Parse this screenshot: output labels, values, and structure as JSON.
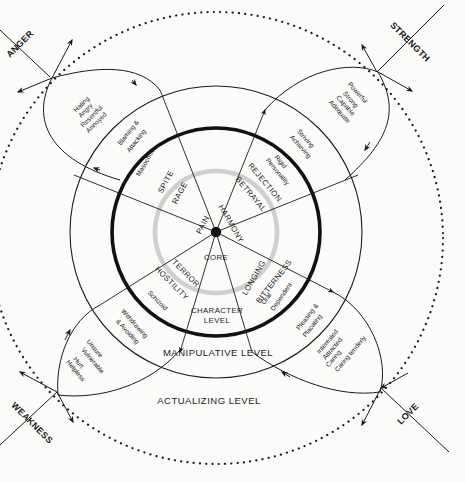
{
  "diagram": {
    "center": {
      "label": "CORE"
    },
    "levels": {
      "character": [
        "CHARACTER",
        "LEVEL"
      ],
      "manipulative": "MANIPULATIVE LEVEL",
      "actualizing": "ACTUALIZING LEVEL"
    },
    "corners": {
      "anger": "ANGER",
      "strength": "STRENGTH",
      "weakness": "WEAKNESS",
      "love": "LOVE"
    },
    "core_words": {
      "pain": "PAIN",
      "harmony": "HARMONY"
    },
    "quadrants": {
      "upper_left": {
        "inner": [
          "SPITE",
          "RAGE"
        ],
        "character": "Masochist",
        "manipulative": [
          "Blaming &",
          "Attacking"
        ],
        "actualizing": [
          "Hating",
          "Angry",
          "Resentful",
          "Annoyed"
        ]
      },
      "upper_right": {
        "inner": [
          "REJECTION",
          "BETRAYAL"
        ],
        "character": [
          "Rigid",
          "Personality"
        ],
        "manipulative": [
          "Striving",
          "Achieving"
        ],
        "actualizing": [
          "Powerful",
          "Strong",
          "Capable",
          "Adequate"
        ]
      },
      "lower_left": {
        "inner": [
          "TERROR",
          "HOSTILITY"
        ],
        "character": "Schizoid",
        "manipulative": [
          "Withdrawing",
          "& Avoiding"
        ],
        "actualizing": [
          "Unsure",
          "Vulnerable",
          "Hurt",
          "Helpless"
        ]
      },
      "lower_right": {
        "inner": [
          "LONGING",
          "BITTERNESS"
        ],
        "character": [
          "Oral",
          "Dependent"
        ],
        "manipulative": [
          "Pleasing &",
          "Placating"
        ],
        "actualizing": [
          "Interested",
          "Attracted",
          "Caring",
          "Caring tenderly"
        ]
      }
    },
    "colors": {
      "ink": "#1a1a1a",
      "core_ring": "#c8c8c8",
      "background": "#fbfbfa"
    }
  }
}
